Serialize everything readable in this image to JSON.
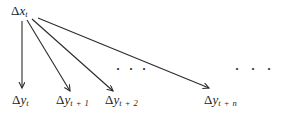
{
  "diagram": {
    "source": {
      "delta": "Δ",
      "var": "x",
      "sub": "t"
    },
    "targets": [
      {
        "delta": "Δ",
        "var": "y",
        "sub": "t"
      },
      {
        "delta": "Δ",
        "var": "y",
        "sub": "t + 1"
      },
      {
        "delta": "Δ",
        "var": "y",
        "sub": "t + 2"
      },
      {
        "delta": "Δ",
        "var": "y",
        "sub": "t + n"
      }
    ],
    "ellipsis_mid": "···",
    "ellipsis_right": "···",
    "colors": {
      "line": "#2b2b2b",
      "text": "#1c1c1c",
      "background": "#ffffff"
    }
  }
}
